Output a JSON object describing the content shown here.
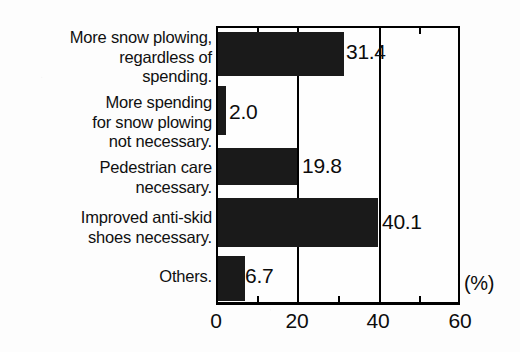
{
  "chart_data": {
    "type": "bar",
    "orientation": "horizontal",
    "title": "",
    "xlabel": "(%)",
    "ylabel": "",
    "xlim": [
      0,
      60
    ],
    "grid": true,
    "legend": false,
    "unit_label": "(%)",
    "categories": [
      "More snow plowing,\nregardless of\nspending.",
      "More spending\nfor snow plowing\nnot necessary.",
      "Pedestrian care\nnecessary.",
      "Improved anti-skid\nshoes necessary.",
      "Others."
    ],
    "values": [
      31.4,
      2.0,
      19.8,
      40.1,
      6.7
    ],
    "value_labels": [
      "31.4",
      "2.0",
      "19.8",
      "40.1",
      "6.7"
    ],
    "xticks": [
      0,
      20,
      40,
      60
    ],
    "xtick_labels": [
      "0",
      "20",
      "40",
      "60"
    ],
    "xminor_ticks": [
      10,
      30,
      50
    ],
    "bar_color": "#1a1a1a",
    "axis_color": "#000000",
    "background_color": "#fdfdfd"
  },
  "bars": [
    {
      "label": "More snow plowing,\nregardless of\nspending.",
      "value": 31.4,
      "value_text": "31.4"
    },
    {
      "label": "More spending\nfor snow plowing\nnot necessary.",
      "value": 2.0,
      "value_text": "2.0"
    },
    {
      "label": "Pedestrian care\nnecessary.",
      "value": 19.8,
      "value_text": "19.8"
    },
    {
      "label": "Improved anti-skid\nshoes necessary.",
      "value": 40.1,
      "value_text": "40.1"
    },
    {
      "label": "Others.",
      "value": 6.7,
      "value_text": "6.7"
    }
  ],
  "axis": {
    "tick_0": "0",
    "tick_20": "20",
    "tick_40": "40",
    "tick_60": "60",
    "unit": "(%)"
  }
}
